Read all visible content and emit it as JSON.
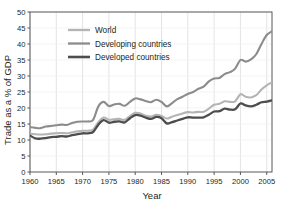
{
  "chart_data": {
    "type": "line",
    "title": "",
    "xlabel": "Year",
    "ylabel": "Trade as a % of GDP",
    "xlim": [
      1960,
      2006
    ],
    "ylim": [
      0,
      50
    ],
    "xticks": [
      1960,
      1965,
      1970,
      1975,
      1980,
      1985,
      1990,
      1995,
      2000,
      2005
    ],
    "yticks": [
      0,
      5,
      10,
      15,
      20,
      25,
      30,
      35,
      40,
      45,
      50
    ],
    "grid": "vertical",
    "legend_position": "upper-left-inside",
    "x": [
      1960,
      1961,
      1962,
      1963,
      1964,
      1965,
      1966,
      1967,
      1968,
      1969,
      1970,
      1971,
      1972,
      1973,
      1974,
      1975,
      1976,
      1977,
      1978,
      1979,
      1980,
      1981,
      1982,
      1983,
      1984,
      1985,
      1986,
      1987,
      1988,
      1989,
      1990,
      1991,
      1992,
      1993,
      1994,
      1995,
      1996,
      1997,
      1998,
      1999,
      2000,
      2001,
      2002,
      2003,
      2004,
      2005,
      2006
    ],
    "series": [
      {
        "name": "World",
        "color": "#b4b4b4",
        "values": [
          12.0,
          11.8,
          11.7,
          11.8,
          12.0,
          12.1,
          12.2,
          12.1,
          12.4,
          12.7,
          12.9,
          12.9,
          13.3,
          15.6,
          17.0,
          16.3,
          16.5,
          16.6,
          16.3,
          17.5,
          18.5,
          18.3,
          17.6,
          17.3,
          17.9,
          17.5,
          16.7,
          17.3,
          17.8,
          18.3,
          18.7,
          18.6,
          18.8,
          18.8,
          19.8,
          21.0,
          21.3,
          22.1,
          21.9,
          22.1,
          24.3,
          23.5,
          23.3,
          24.0,
          25.8,
          27.1,
          28.0
        ]
      },
      {
        "name": "Developing countries",
        "color": "#8c8c8c",
        "values": [
          14.0,
          13.8,
          13.7,
          14.2,
          14.4,
          14.6,
          14.8,
          14.7,
          15.3,
          15.7,
          15.8,
          15.8,
          16.3,
          20.5,
          21.9,
          20.6,
          21.1,
          21.3,
          20.7,
          21.9,
          23.0,
          22.7,
          22.2,
          21.8,
          22.6,
          21.9,
          20.5,
          21.5,
          22.8,
          23.5,
          24.4,
          25.0,
          26.0,
          26.7,
          28.3,
          29.2,
          29.4,
          30.6,
          31.2,
          32.3,
          35.0,
          34.5,
          35.2,
          36.8,
          40.0,
          42.8,
          44.0
        ]
      },
      {
        "name": "Developed countries",
        "color": "#4d4d4d",
        "values": [
          11.4,
          10.5,
          10.4,
          10.6,
          10.9,
          11.0,
          11.2,
          11.1,
          11.5,
          11.8,
          12.1,
          12.1,
          12.5,
          14.8,
          16.2,
          15.4,
          15.7,
          15.8,
          15.5,
          16.8,
          17.8,
          17.6,
          17.0,
          16.6,
          17.2,
          16.8,
          15.2,
          15.6,
          16.1,
          16.6,
          17.1,
          17.0,
          17.0,
          17.1,
          17.9,
          18.9,
          19.0,
          19.8,
          19.5,
          19.6,
          21.4,
          20.8,
          20.5,
          21.0,
          21.8,
          22.0,
          22.4
        ]
      }
    ]
  },
  "legend": {
    "items": [
      {
        "label": "World"
      },
      {
        "label": "Developing countries"
      },
      {
        "label": "Developed countries"
      }
    ]
  },
  "axes": {
    "y_title": "Trade as a % of GDP",
    "x_title": "Year",
    "y_ticks": [
      "0",
      "5",
      "10",
      "15",
      "20",
      "25",
      "30",
      "35",
      "40",
      "45",
      "50"
    ],
    "x_ticks": [
      "1960",
      "1965",
      "1970",
      "1975",
      "1980",
      "1985",
      "1990",
      "1995",
      "2000",
      "2005"
    ]
  },
  "colors": {
    "world": "#b4b4b4",
    "developing": "#8c8c8c",
    "developed": "#4d4d4d",
    "axis": "#58595b",
    "grid": "#d9d9d9",
    "text": "#231f20",
    "background": "#ffffff"
  }
}
